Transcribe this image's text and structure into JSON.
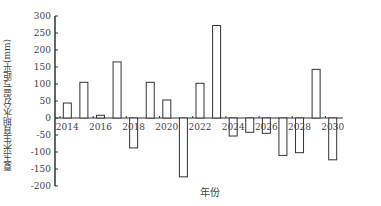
{
  "chart_data": {
    "type": "bar",
    "title": "",
    "xlabel": "年份",
    "ylabel": "夏玉米生育期水分盈亏距平(mm)",
    "categories": [
      "2014",
      "2015",
      "2016",
      "2017",
      "2018",
      "2019",
      "2020",
      "2021",
      "2022",
      "2023",
      "2024",
      "2025",
      "2026",
      "2027",
      "2028",
      "2029",
      "2030"
    ],
    "values": [
      44,
      105,
      8,
      165,
      -88,
      105,
      53,
      -173,
      102,
      272,
      -53,
      -42,
      -45,
      -110,
      -102,
      143,
      -123
    ],
    "ylim": [
      -200,
      300
    ],
    "yticks": [
      300,
      250,
      200,
      150,
      100,
      50,
      0,
      -50,
      -100,
      -150,
      -200
    ],
    "xtick_labels": [
      "2014",
      "2016",
      "2018",
      "2020",
      "2022",
      "2024",
      "2026",
      "2028",
      "2030"
    ],
    "grid": false,
    "legend": null,
    "bar_fill": "#ffffff",
    "bar_stroke": "#333333"
  }
}
